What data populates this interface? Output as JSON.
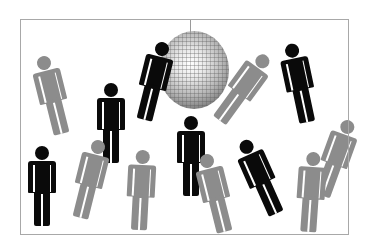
{
  "illustration": {
    "description": "Crowd of pictogram figures around a disco ball inside a thin rectangular frame",
    "colors": {
      "background": "#ffffff",
      "frame": "#a8a8a8",
      "figure_black": "#0a0a0a",
      "figure_gray": "#8c8c8c",
      "disco_ball": "#b5b5b5"
    },
    "disco_ball": {
      "cx": 194,
      "cy": 70,
      "w": 70,
      "h": 78
    },
    "figures": [
      {
        "color": "gray",
        "x": 38,
        "y": 55,
        "rotate": -14
      },
      {
        "color": "black",
        "x": 97,
        "y": 83,
        "rotate": 0
      },
      {
        "color": "black",
        "x": 140,
        "y": 41,
        "rotate": 14
      },
      {
        "color": "gray",
        "x": 229,
        "y": 48,
        "rotate": 36
      },
      {
        "color": "black",
        "x": 285,
        "y": 43,
        "rotate": -12
      },
      {
        "color": "black",
        "x": 28,
        "y": 146,
        "rotate": 0
      },
      {
        "color": "gray",
        "x": 76,
        "y": 139,
        "rotate": 14
      },
      {
        "color": "gray",
        "x": 127,
        "y": 150,
        "rotate": 3
      },
      {
        "color": "black",
        "x": 177,
        "y": 116,
        "rotate": 0
      },
      {
        "color": "gray",
        "x": 201,
        "y": 153,
        "rotate": -14
      },
      {
        "color": "black",
        "x": 246,
        "y": 137,
        "rotate": -24
      },
      {
        "color": "gray",
        "x": 322,
        "y": 118,
        "rotate": 20
      },
      {
        "color": "gray",
        "x": 297,
        "y": 152,
        "rotate": 4
      }
    ]
  }
}
